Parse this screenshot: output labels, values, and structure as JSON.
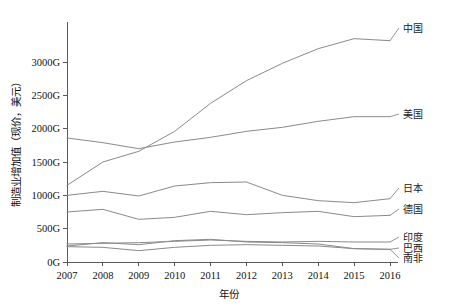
{
  "chart_data": {
    "type": "line",
    "title": "",
    "xlabel": "年份",
    "ylabel": "制造业增加值（现价，美元）",
    "x": [
      2007,
      2008,
      2009,
      2010,
      2011,
      2012,
      2013,
      2014,
      2015,
      2016
    ],
    "xtick_labels": [
      "2007",
      "2008",
      "2009",
      "2010",
      "2011",
      "2012",
      "2013",
      "2014",
      "2015",
      "2016"
    ],
    "ytick_labels": [
      "0G",
      "500G",
      "1000G",
      "1500G",
      "2000G",
      "2500G",
      "3000G"
    ],
    "ytick_values": [
      0,
      500,
      1000,
      1500,
      2000,
      2500,
      3000
    ],
    "ylim": [
      0,
      3600
    ],
    "xlim": [
      2007,
      2016
    ],
    "grid": false,
    "legend_position": "right-inline",
    "units": "G (十亿美元)",
    "series": [
      {
        "name": "中国",
        "label": "中国",
        "color": "#8a8a8a",
        "values": [
          1150,
          1500,
          1660,
          1960,
          2380,
          2720,
          2980,
          3200,
          3350,
          3320
        ]
      },
      {
        "name": "美国",
        "label": "美国",
        "color": "#8a8a8a",
        "values": [
          1860,
          1790,
          1700,
          1800,
          1870,
          1960,
          2020,
          2110,
          2180,
          2180
        ]
      },
      {
        "name": "日本",
        "label": "日本",
        "color": "#8a8a8a",
        "values": [
          1000,
          1060,
          990,
          1140,
          1190,
          1200,
          1000,
          920,
          890,
          950
        ]
      },
      {
        "name": "德国",
        "label": "德国",
        "color": "#8a8a8a",
        "values": [
          750,
          790,
          640,
          670,
          760,
          710,
          740,
          760,
          680,
          700
        ]
      },
      {
        "name": "印度",
        "label": "印度",
        "color": "#8a8a8a",
        "values": [
          270,
          280,
          290,
          310,
          330,
          310,
          300,
          310,
          300,
          300
        ]
      },
      {
        "name": "巴西",
        "label": "巴西",
        "color": "#8a8a8a",
        "values": [
          240,
          290,
          260,
          320,
          340,
          300,
          290,
          270,
          200,
          190
        ]
      },
      {
        "name": "南非",
        "label": "南非",
        "color": "#8a8a8a",
        "values": [
          230,
          220,
          170,
          220,
          250,
          260,
          250,
          240,
          200,
          190
        ]
      }
    ]
  },
  "geometry": {
    "plot_left": 67,
    "plot_right": 390,
    "plot_top": 22,
    "plot_bottom": 262,
    "label_x": 402
  },
  "labels": {
    "x_axis_title": "年份",
    "y_axis_title": "制造业增加值（现价，美元）"
  }
}
